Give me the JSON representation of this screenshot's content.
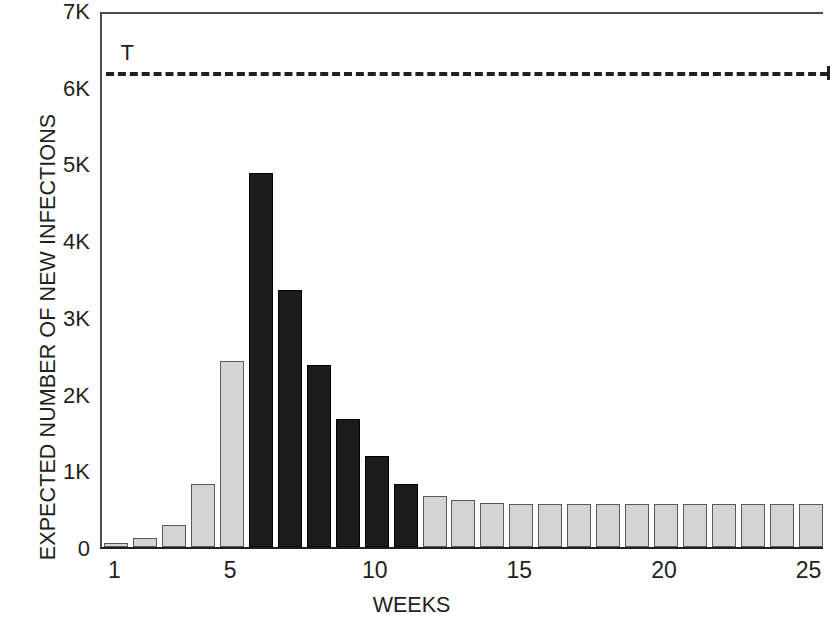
{
  "chart_data": {
    "type": "bar",
    "title": "",
    "xlabel": "WEEKS",
    "ylabel": "EXPECTED NUMBER OF NEW INFECTIONS",
    "categories": [
      1,
      2,
      3,
      4,
      5,
      6,
      7,
      8,
      9,
      10,
      11,
      12,
      13,
      14,
      15,
      16,
      17,
      18,
      19,
      20,
      21,
      22,
      23,
      24,
      25
    ],
    "values": [
      50,
      120,
      290,
      820,
      2420,
      4870,
      3350,
      2370,
      1670,
      1180,
      820,
      670,
      610,
      580,
      560,
      555,
      555,
      555,
      555,
      555,
      555,
      555,
      555,
      555,
      555
    ],
    "bar_colors": [
      "#d4d4d4",
      "#d4d4d4",
      "#d4d4d4",
      "#d4d4d4",
      "#d4d4d4",
      "#1b1b1b",
      "#1b1b1b",
      "#1b1b1b",
      "#1b1b1b",
      "#1b1b1b",
      "#1b1b1b",
      "#d4d4d4",
      "#d4d4d4",
      "#d4d4d4",
      "#d4d4d4",
      "#d4d4d4",
      "#d4d4d4",
      "#d4d4d4",
      "#d4d4d4",
      "#d4d4d4",
      "#d4d4d4",
      "#d4d4d4",
      "#d4d4d4",
      "#d4d4d4",
      "#d4d4d4"
    ],
    "highlight_color": "#1b1b1b",
    "base_color": "#d4d4d4",
    "ylim": [
      0,
      7000
    ],
    "xlim": [
      0.5,
      25.5
    ],
    "ytick_values": [
      0,
      1000,
      2000,
      3000,
      4000,
      5000,
      6000,
      7000
    ],
    "ytick_labels": [
      "0",
      "1K",
      "2K",
      "3K",
      "4K",
      "5K",
      "6K",
      "7K"
    ],
    "xtick_values": [
      1,
      5,
      10,
      15,
      20,
      25
    ],
    "xtick_labels": [
      "1",
      "5",
      "10",
      "15",
      "20",
      "25"
    ],
    "grid": false,
    "legend": false,
    "annotations": [
      {
        "name": "threshold",
        "label": "T",
        "y": 6250,
        "x_start": 1,
        "x_end": 25,
        "style": "dashed",
        "color": "#231f20"
      }
    ]
  }
}
